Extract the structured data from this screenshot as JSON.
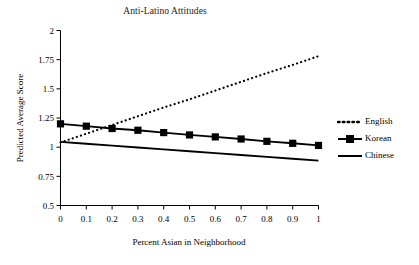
{
  "chart_data": {
    "type": "line",
    "title": "Anti-Latino Attitudes",
    "xlabel": "Percent Asian in Neighborhood",
    "ylabel": "Predicted Average Score",
    "x": [
      0,
      0.1,
      0.2,
      0.3,
      0.4,
      0.5,
      0.6,
      0.7,
      0.8,
      0.9,
      1
    ],
    "xlim": [
      0,
      1
    ],
    "ylim": [
      0.5,
      2
    ],
    "xticks": [
      "0",
      "0.1",
      "0.2",
      "0.3",
      "0.4",
      "0.5",
      "0.6",
      "0.7",
      "0.8",
      "0.9",
      "1"
    ],
    "yticks": [
      "0.5",
      "0.75",
      "1",
      "1.25",
      "1.5",
      "1.75",
      "2"
    ],
    "ytick_values": [
      0.5,
      0.75,
      1,
      1.25,
      1.5,
      1.75,
      2
    ],
    "grid": false,
    "legend_position": "right",
    "series": [
      {
        "name": "English",
        "style": "dotted",
        "marker": "none",
        "color": "#000000",
        "values": [
          1.04,
          1.115,
          1.19,
          1.265,
          1.34,
          1.41,
          1.485,
          1.56,
          1.635,
          1.705,
          1.78
        ]
      },
      {
        "name": "Korean",
        "style": "solid",
        "marker": "square",
        "color": "#000000",
        "values": [
          1.2,
          1.18,
          1.16,
          1.145,
          1.125,
          1.105,
          1.088,
          1.07,
          1.05,
          1.033,
          1.015
        ]
      },
      {
        "name": "Chinese",
        "style": "solid",
        "marker": "none",
        "color": "#000000",
        "values": [
          1.045,
          1.029,
          1.013,
          0.997,
          0.981,
          0.965,
          0.949,
          0.933,
          0.917,
          0.901,
          0.885
        ]
      }
    ]
  },
  "legend": {
    "items": [
      {
        "label": "English"
      },
      {
        "label": "Korean"
      },
      {
        "label": "Chinese"
      }
    ]
  }
}
